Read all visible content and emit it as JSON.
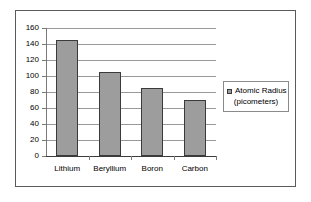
{
  "chart_data": {
    "type": "bar",
    "title": "",
    "xlabel": "",
    "ylabel": "",
    "categories": [
      "Lithium",
      "Beryllium",
      "Boron",
      "Carbon"
    ],
    "values": [
      145,
      105,
      85,
      70
    ],
    "series": [
      {
        "name": "Atomic Radius (picometers)",
        "values": [
          145,
          105,
          85,
          70
        ]
      }
    ],
    "ylim": [
      0,
      160
    ],
    "ytick_labels": [
      "0",
      "20",
      "40",
      "60",
      "80",
      "100",
      "120",
      "140",
      "160"
    ],
    "ytick_values": [
      0,
      20,
      40,
      60,
      80,
      100,
      120,
      140,
      160
    ],
    "grid": true,
    "legend_position": "right",
    "bar_color": "#9d9d9d",
    "bar_border_color": "#3a3a3a",
    "gridline_color": "#9a9a9a",
    "axis_color": "#7a7a7a",
    "frame_color": "#5a5a5a",
    "background_color": "#ffffff"
  },
  "legend": {
    "marker_name": "legend-swatch",
    "line1": "Atomic Radius",
    "line2": "(picometers)"
  }
}
